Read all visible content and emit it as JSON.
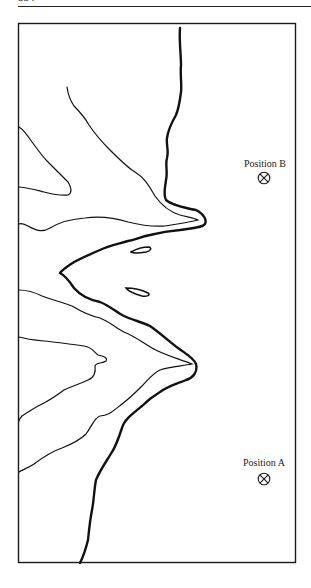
{
  "page": {
    "number": "334"
  },
  "figure": {
    "frame": {
      "x": 18,
      "y": 23,
      "width": 278,
      "height": 540,
      "stroke": "#1a1a1a"
    },
    "positions": [
      {
        "id": "B",
        "label": "Position B",
        "label_x": 265,
        "label_y": 158,
        "symbol_x": 264,
        "symbol_y": 178,
        "symbol": "circle-x-marker"
      },
      {
        "id": "A",
        "label": "Position A",
        "label_x": 264,
        "label_y": 457,
        "symbol_x": 264,
        "symbol_y": 479,
        "symbol": "circle-x-marker"
      }
    ],
    "line_color": "#111111"
  }
}
